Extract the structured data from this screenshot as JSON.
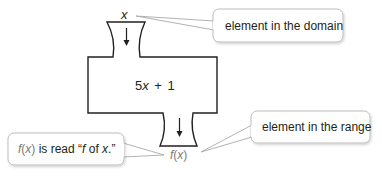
{
  "diagram": {
    "type": "function-machine",
    "input_label": "x",
    "rule": {
      "coefficient": "5",
      "variable": "x",
      "operator": "+",
      "constant": "1"
    },
    "output_label": "f(x)",
    "output_parts": {
      "f": "f",
      "open": "(",
      "var": "x",
      "close": ")"
    },
    "callouts": {
      "domain": {
        "text": "element in the domain"
      },
      "range": {
        "text": "element in the range"
      },
      "notation": {
        "f": "f",
        "open": "(",
        "var": "x",
        "close": ")",
        "mid": " is read “",
        "f2": "f",
        "of": " of ",
        "x2": "x",
        "end": ".”"
      }
    },
    "colors": {
      "stroke": "#231f20",
      "callout_border": "#bdbdbd",
      "pointer": "#a9a9a9",
      "gray_text": "#7a7a7a"
    }
  }
}
